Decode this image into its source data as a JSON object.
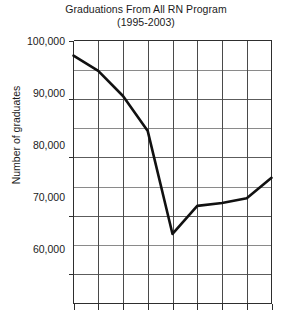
{
  "chart_data": {
    "type": "line",
    "title": "Graduations From All RN Program",
    "subtitle": "(1995-2003)",
    "xlabel": "",
    "ylabel": "Number of graduates",
    "ylim": [
      55000,
      100000
    ],
    "ytick_labels": [
      "100,000",
      "90,000",
      "80,000",
      "70,000",
      "60,000"
    ],
    "ytick_values": [
      100000,
      90000,
      80000,
      70000,
      60000
    ],
    "minor_tick_interval": 5000,
    "grid": true,
    "legend": "none",
    "x": [
      1995,
      1996,
      1997,
      1998,
      1999,
      2000,
      2001,
      2002,
      2003
    ],
    "categories": [
      "1995",
      "1996",
      "1997",
      "1998",
      "1999",
      "2000",
      "2001",
      "2002",
      "2003"
    ],
    "values": [
      97400,
      94800,
      90500,
      84500,
      66900,
      71700,
      72200,
      73000,
      76500
    ],
    "series": [
      {
        "name": "Graduations From All RN Program",
        "values": [
          97400,
          94800,
          90500,
          84500,
          66900,
          71700,
          72200,
          73000,
          76500
        ]
      }
    ],
    "line_color": "#111111",
    "grid_color": "#707070",
    "axis_color": "#3a3a3a",
    "background": "#ffffff",
    "note": "x-axis tick labels are cropped below the bottom edge of the image"
  }
}
